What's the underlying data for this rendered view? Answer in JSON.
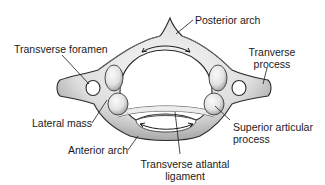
{
  "diagram": {
    "colors": {
      "bone_fill": "#e4e4e4",
      "bone_light": "#f4f4f4",
      "bone_shadow": "#8a8a8a",
      "outline": "#2a2a2a",
      "text": "#1a1a1a",
      "background": "#ffffff"
    },
    "labels": {
      "posterior_arch": "Posterior arch",
      "transverse_foramen": "Transverse foramen",
      "tranverse_process_line1": "Tranverse",
      "tranverse_process_line2": "process",
      "lateral_mass": "Lateral mass",
      "superior_articular_line1": "Superior articular",
      "superior_articular_line2": "process",
      "anterior_arch": "Anterior arch",
      "transverse_ligament_line1": "Transverse atlantal",
      "transverse_ligament_line2": "ligament"
    }
  }
}
